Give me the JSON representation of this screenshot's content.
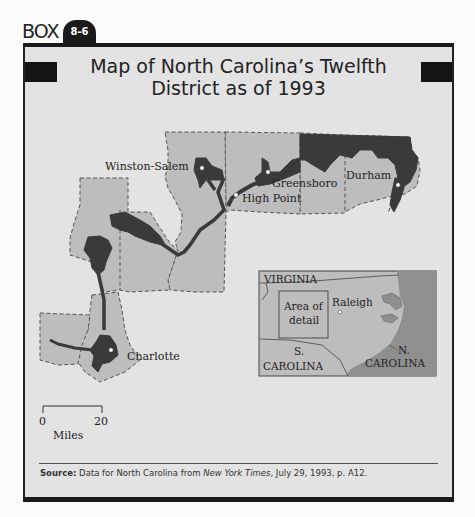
{
  "header": {
    "box_label": "BOX",
    "box_number": "8-6",
    "title_line1": "Map of North Carolina’s Twelfth",
    "title_line2": "District as of 1993"
  },
  "map": {
    "cities": [
      {
        "name": "Winston-Salem"
      },
      {
        "name": "High Point"
      },
      {
        "name": "Greensboro"
      },
      {
        "name": "Durham"
      },
      {
        "name": "Charlotte"
      }
    ],
    "scale": {
      "start": "0",
      "end": "20",
      "unit": "Miles"
    },
    "colors": {
      "background": "#e3e3e3",
      "counties": "#bdbdbd",
      "district": "#3a3a3a",
      "ocean": "#8f8f8f"
    }
  },
  "inset": {
    "labels": {
      "virginia": "VIRGINIA",
      "area_of_detail_1": "Area of",
      "area_of_detail_2": "detail",
      "raleigh": "Raleigh",
      "sc_1": "S.",
      "sc_2": "CAROLINA",
      "nc_1": "N.",
      "nc_2": "CAROLINA"
    }
  },
  "source": {
    "label": "Source:",
    "text_pre": " Data for North Carolina from ",
    "publication": "New York Times",
    "text_post": ", July 29, 1993, p. A12."
  }
}
